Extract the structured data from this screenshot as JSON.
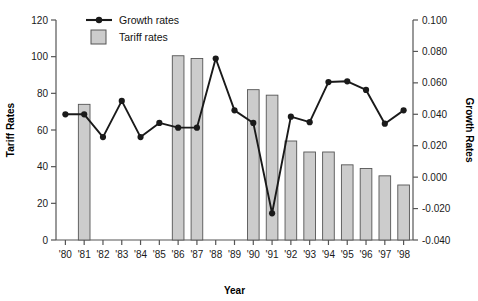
{
  "chart_data": {
    "type": "bar",
    "title": "",
    "xlabel": "Year",
    "ylabel": "Tariff Rates",
    "y2label": "Growth Rates",
    "categories": [
      "'80",
      "'81",
      "'82",
      "'83",
      "'84",
      "'85",
      "'86",
      "'87",
      "'88",
      "'89",
      "'90",
      "'91",
      "'92",
      "'93",
      "'94",
      "'95",
      "'96",
      "'97",
      "'98"
    ],
    "ylim": [
      0,
      120
    ],
    "yticks": [
      0,
      20,
      40,
      60,
      80,
      100,
      120
    ],
    "ytick_labels": [
      "0",
      "20",
      "40",
      "60",
      "80",
      "100",
      "120"
    ],
    "y2lim": [
      -0.04,
      0.1
    ],
    "y2ticks": [
      -0.04,
      -0.02,
      0.0,
      0.02,
      0.04,
      0.06,
      0.08,
      0.1
    ],
    "y2tick_labels": [
      "-0.040",
      "-0.020",
      "0.000",
      "0.020",
      "0.040",
      "0.060",
      "0.080",
      "0.100"
    ],
    "grid": false,
    "legend_position": "top-left",
    "series": [
      {
        "name": "Tariff rates",
        "type": "bar",
        "axis": "left",
        "color": "#cccccc",
        "edge_color": "#555555",
        "values": [
          null,
          74,
          null,
          null,
          null,
          null,
          100.5,
          99,
          null,
          null,
          82,
          79,
          54,
          48,
          48,
          41,
          39,
          35,
          30
        ]
      },
      {
        "name": "Growth rates",
        "type": "line",
        "axis": "right",
        "color": "#1a1a1a",
        "values": [
          0.04,
          0.04,
          0.0255,
          0.0485,
          0.0255,
          0.0345,
          0.0315,
          0.0315,
          0.0755,
          0.0425,
          0.0345,
          -0.023,
          0.0385,
          0.035,
          0.0605,
          0.061,
          0.0555,
          0.034,
          0.0425
        ]
      }
    ]
  },
  "legend": {
    "items": [
      {
        "label": "Growth rates",
        "marker": "line-with-dot",
        "color": "#1a1a1a"
      },
      {
        "label": "Tariff rates",
        "marker": "filled-square",
        "color": "#cccccc"
      }
    ]
  },
  "axes": {
    "left_title": "Tariff Rates",
    "right_title": "Growth Rates",
    "bottom_title": "Year"
  },
  "colors": {
    "bar_fill": "#cccccc",
    "bar_edge": "#555555",
    "line": "#1a1a1a",
    "axis": "#555555",
    "text": "#111111",
    "background": "#ffffff"
  }
}
